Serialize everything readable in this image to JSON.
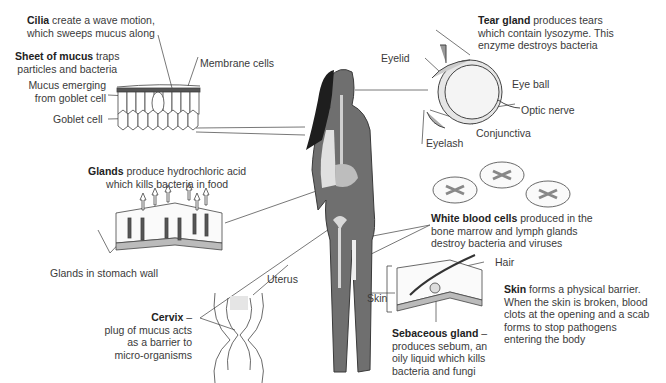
{
  "diagram": {
    "colors": {
      "body": "#6f6f6f",
      "body_outline": "#3a3a3a",
      "hair": "#1e1e1e",
      "organ_light": "#d9d9d9",
      "line": "#444444",
      "text": "#3a3a3a"
    },
    "labels": {
      "cilia": {
        "bold": "Cilia",
        "line1": " create a wave motion,",
        "line2": "which sweeps mucus along"
      },
      "mucus_sheet": {
        "bold": "Sheet of mucus",
        "line1": " traps",
        "line2": "particles and bacteria"
      },
      "membrane_cells": "Membrane cells",
      "mucus_emerging": {
        "line1": "Mucus emerging",
        "line2": "from goblet cell"
      },
      "goblet_cell": "Goblet cell",
      "tear_gland": {
        "bold": "Tear gland",
        "line1": " produces tears",
        "line2": "which contain lysozyme. This",
        "line3": "enzyme destroys bacteria"
      },
      "eyelid": "Eyelid",
      "eye_ball": "Eye ball",
      "optic_nerve": "Optic nerve",
      "conjunctiva": "Conjunctiva",
      "eyelash": "Eyelash",
      "glands": {
        "bold": "Glands",
        "line1": " produce hydrochloric acid",
        "line2": "which kills bacteria in food"
      },
      "glands_stomach_wall": "Glands in stomach wall",
      "white_blood_cells": {
        "bold": "White blood cells",
        "line1": " produced in the",
        "line2": "bone marrow and lymph glands",
        "line3": "destroy bacteria and viruses"
      },
      "uterus": "Uterus",
      "cervix": {
        "bold": "Cervix",
        "dash": " –",
        "line2": "plug of mucus acts",
        "line3": "as a barrier to",
        "line4": "micro-organisms"
      },
      "skin": "Skin",
      "hair": "Hair",
      "skin_desc": {
        "bold": "Skin",
        "line1": " forms a physical barrier.",
        "line2": "When the skin is broken, blood",
        "line3": "clots at the opening and a scab",
        "line4": "forms to stop pathogens",
        "line5": "entering the body"
      },
      "sebaceous": {
        "bold": "Sebaceous gland",
        "dash": " –",
        "line2": "produces sebum, an",
        "line3": "oily liquid which kills",
        "line4": "bacteria and fungi"
      }
    }
  }
}
